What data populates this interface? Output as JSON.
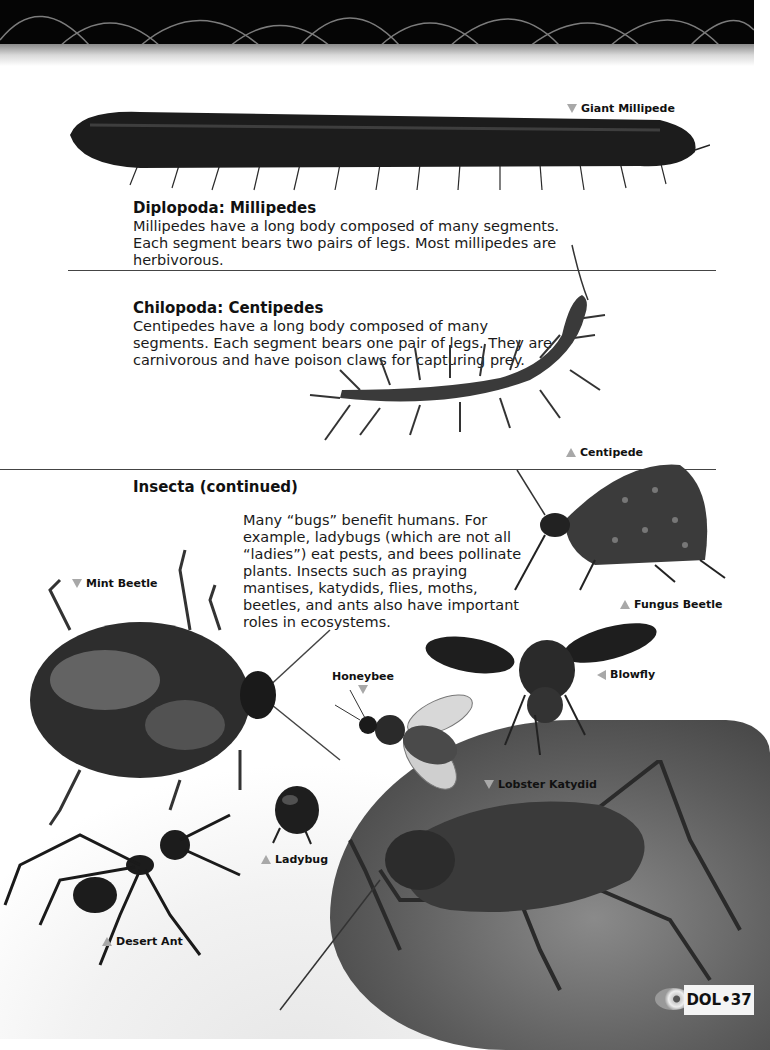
{
  "page": {
    "number_label": "DOL•37",
    "accent_color": "#a8a8a8"
  },
  "sections": {
    "diplopoda": {
      "heading": "Diplopoda: Millipedes",
      "body": "Millipedes have a long body composed of many segments. Each segment bears two pairs of legs. Most millipedes are herbivorous."
    },
    "chilopoda": {
      "heading": "Chilopoda: Centipedes",
      "body": "Centipedes have a long body composed of many segments. Each segment bears one pair of legs. They are carnivorous and have poison claws for capturing prey."
    },
    "insecta": {
      "heading": "Insecta (continued)",
      "body": "Many “bugs” benefit humans. For example, ladybugs (which are not all “ladies”) eat pests, and bees pollinate plants. Insects such as praying mantises, katydids, flies, moths, beetles, and ants also have important roles in ecosystems."
    }
  },
  "labels": {
    "giant_millipede": "Giant Millipede",
    "centipede": "Centipede",
    "mint_beetle": "Mint Beetle",
    "fungus_beetle": "Fungus Beetle",
    "honeybee": "Honeybee",
    "blowfly": "Blowfly",
    "lobster_katydid": "Lobster Katydid",
    "ladybug": "Ladybug",
    "desert_ant": "Desert Ant"
  }
}
